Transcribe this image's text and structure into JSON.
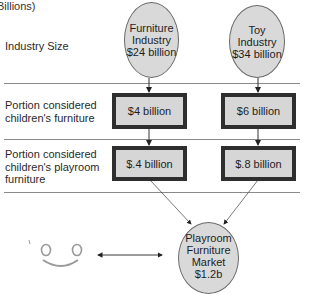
{
  "unit_label": "Billions)",
  "rows": [
    {
      "label_lines": [
        "Industry Size"
      ]
    },
    {
      "label_lines": [
        "Portion considered",
        "children's furniture"
      ]
    },
    {
      "label_lines": [
        "Portion considered",
        "children's playroom",
        "furniture"
      ]
    }
  ],
  "top_circles": [
    {
      "lines": [
        "Furniture",
        "Industry",
        "$24 billion"
      ]
    },
    {
      "lines": [
        "Toy",
        "Industry",
        "$34 billion"
      ]
    }
  ],
  "children_boxes": [
    {
      "value": "$4 billion"
    },
    {
      "value": "$6 billion"
    }
  ],
  "playroom_boxes": [
    {
      "value": "$.4 billion"
    },
    {
      "value": "$.8 billion"
    }
  ],
  "result_circle": {
    "lines": [
      "Playroom",
      "Furniture",
      "Market",
      "$1.2b"
    ]
  },
  "icons": {
    "face": "smiley-face-icon",
    "arrow": "double-headed-arrow"
  },
  "colors": {
    "circle_fill": "#d9d9d9",
    "box_fill": "#d6d6d6",
    "box_border": "#2e2e2e",
    "divider": "#8a8a8a"
  }
}
